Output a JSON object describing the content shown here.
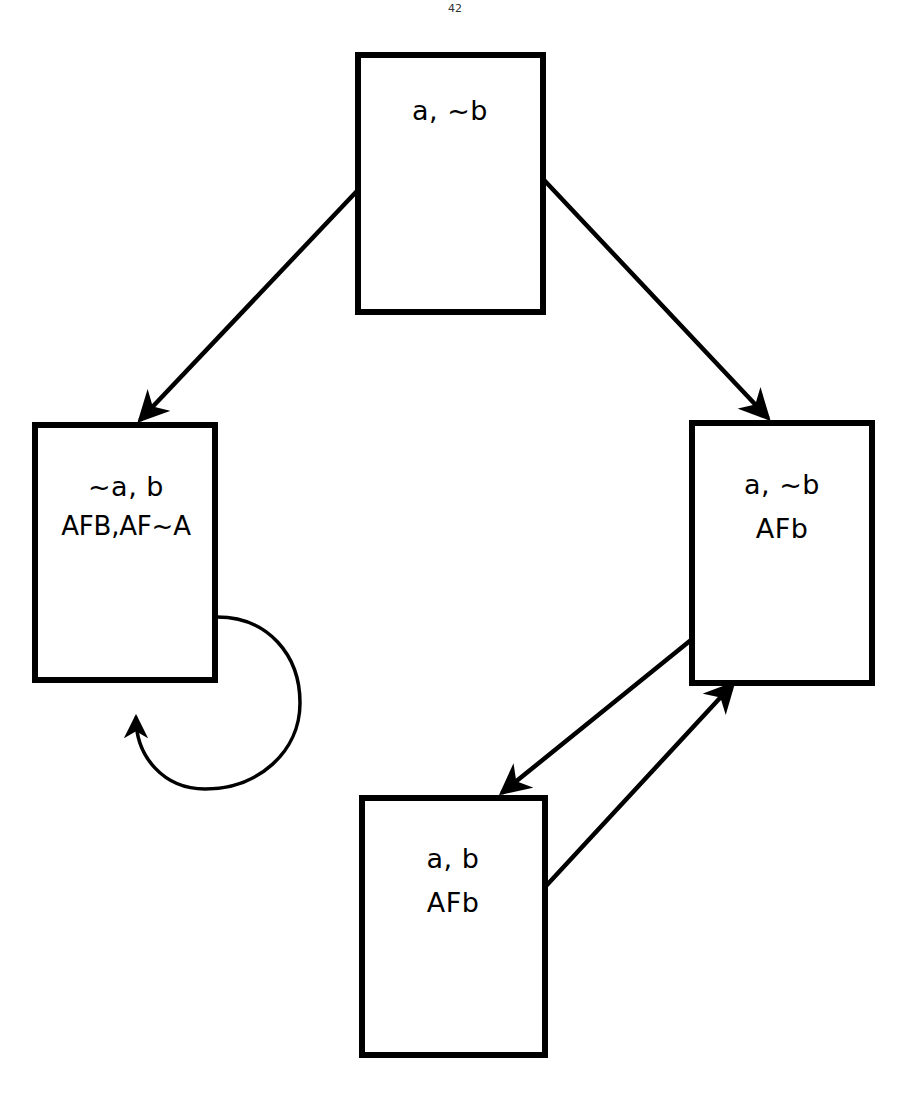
{
  "figure": {
    "type": "state-transition-diagram",
    "background_color": "#ffffff",
    "stroke_color": "#000000",
    "page_marker": "42"
  },
  "nodes": [
    {
      "id": "top",
      "name": "state-node-top",
      "x": 358,
      "y": 55,
      "width": 185,
      "height": 257,
      "lines": [
        "a, ~b"
      ]
    },
    {
      "id": "left",
      "name": "state-node-left",
      "x": 35,
      "y": 425,
      "width": 180,
      "height": 255,
      "lines": [
        "~a, b",
        "AFB,AF~A"
      ]
    },
    {
      "id": "right",
      "name": "state-node-right",
      "x": 692,
      "y": 423,
      "width": 180,
      "height": 260,
      "lines": [
        "a, ~b",
        "AFb"
      ]
    },
    {
      "id": "bottom",
      "name": "state-node-bottom",
      "x": 362,
      "y": 798,
      "width": 183,
      "height": 257,
      "lines": [
        "a, b",
        "AFb"
      ]
    }
  ],
  "edges": [
    {
      "id": "top-to-left",
      "name": "edge-top-to-left",
      "from": "top",
      "to": "left",
      "kind": "straight",
      "x1": 357,
      "y1": 191,
      "x2": 137,
      "y2": 423,
      "label": ""
    },
    {
      "id": "top-to-right",
      "name": "edge-top-to-right",
      "from": "top",
      "to": "right",
      "kind": "straight",
      "x1": 544,
      "y1": 180,
      "x2": 770,
      "y2": 421,
      "label": ""
    },
    {
      "id": "right-to-bottom",
      "name": "edge-right-to-bottom",
      "from": "right",
      "to": "bottom",
      "kind": "straight",
      "x1": 691,
      "y1": 640,
      "x2": 498,
      "y2": 796,
      "label": ""
    },
    {
      "id": "bottom-to-right",
      "name": "edge-bottom-to-right",
      "from": "bottom",
      "to": "right",
      "kind": "straight",
      "x1": 546,
      "y1": 886,
      "x2": 736,
      "y2": 681,
      "label": ""
    },
    {
      "id": "left-self-loop",
      "name": "edge-left-self-loop",
      "from": "left",
      "to": "left",
      "kind": "self-loop",
      "x1": 216,
      "y1": 617,
      "x2": 136,
      "y2": 684,
      "label": ""
    }
  ]
}
